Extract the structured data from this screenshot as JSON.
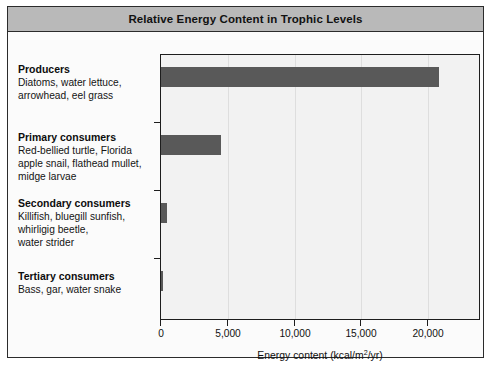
{
  "figure": {
    "title": "Relative Energy Content in Trophic Levels",
    "title_bar_color": "#b9b9b9",
    "frame_color": "#2b2b2b",
    "plot_background": "#f2f2f2",
    "bar_color": "#595959"
  },
  "categories": [
    {
      "key": "producers",
      "title": "Producers",
      "description_lines": [
        "Diatoms, water lettuce,",
        "arrowhead, eel grass"
      ]
    },
    {
      "key": "primary-consumers",
      "title": "Primary consumers",
      "description_lines": [
        "Red-bellied turtle, Florida",
        "apple snail, flathead mullet,",
        "midge larvae"
      ]
    },
    {
      "key": "secondary-consumers",
      "title": "Secondary consumers",
      "description_lines": [
        "Killifish, bluegill sunfish,",
        "whirligig beetle,",
        "water strider"
      ]
    },
    {
      "key": "tertiary-consumers",
      "title": "Tertiary consumers",
      "description_lines": [
        "Bass, gar, water snake"
      ]
    }
  ],
  "axis": {
    "x_title_prefix": "Energy content (kcal/m",
    "x_title_sup": "2",
    "x_title_suffix": "/yr)",
    "tick_labels": [
      "0",
      "5,000",
      "10,000",
      "15,000",
      "20,000"
    ],
    "tick_values": [
      0,
      5000,
      10000,
      15000,
      20000
    ]
  },
  "chart_data": {
    "type": "bar",
    "orientation": "horizontal",
    "title": "Relative Energy Content in Trophic Levels",
    "categories": [
      "Producers",
      "Primary consumers",
      "Secondary consumers",
      "Tertiary consumers"
    ],
    "values": [
      20810,
      4500,
      450,
      150
    ],
    "xlabel": "Energy content (kcal/m2/yr)",
    "ylabel": "",
    "xlim": [
      0,
      23800
    ],
    "xticks": [
      0,
      5000,
      10000,
      15000,
      20000
    ],
    "grid": true,
    "legend": false,
    "series_color": "#595959"
  }
}
